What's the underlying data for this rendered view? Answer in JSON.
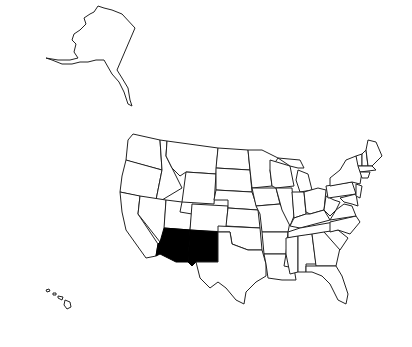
{
  "map": {
    "title": "",
    "subject": "United States",
    "background_color": "#ffffff",
    "outline_color": "#222222",
    "highlight_color": "#000000",
    "highlighted_states": [
      "Arizona",
      "New Mexico"
    ],
    "insets": [
      "Alaska",
      "Hawaii"
    ]
  }
}
